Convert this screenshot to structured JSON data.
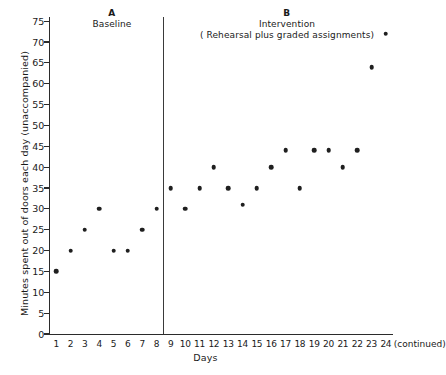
{
  "chart_data": {
    "type": "scatter",
    "title": "",
    "xlabel": "Days",
    "ylabel": "Minutes spent out of doors each day (unaccompanied)",
    "xlim": [
      0.5,
      24.5
    ],
    "ylim": [
      0,
      76
    ],
    "grid": false,
    "legend": "none",
    "x_tick_labels": [
      "1",
      "2",
      "3",
      "4",
      "5",
      "6",
      "7",
      "8",
      "9",
      "10",
      "11",
      "12",
      "13",
      "14",
      "15",
      "16",
      "17",
      "18",
      "19",
      "20",
      "21",
      "22",
      "23",
      "24"
    ],
    "x_extra_label": "(continued)",
    "y_ticks": [
      0,
      5,
      10,
      15,
      20,
      25,
      30,
      35,
      40,
      45,
      50,
      55,
      60,
      65,
      70,
      75
    ],
    "phase_divider_x": 12.5,
    "phases": [
      {
        "letter": "A",
        "name": "Baseline",
        "sub": "",
        "x_start": 1,
        "x_end": 12
      },
      {
        "letter": "B",
        "name": "Intervention",
        "sub": "( Rehearsal plus graded assignments)",
        "x_start": 13,
        "x_end": 24
      }
    ],
    "series": [
      {
        "name": "Minutes out of doors",
        "marker": "filled-circle",
        "color": "#1f1f1f",
        "x": [
          1,
          2,
          3,
          4,
          5,
          6,
          7,
          8,
          9,
          10,
          11,
          12,
          13,
          14,
          15,
          16,
          17,
          18,
          19,
          20,
          21,
          22,
          23,
          24
        ],
        "values": [
          15,
          20,
          25,
          30,
          20,
          20,
          25,
          30,
          35,
          30,
          35,
          40,
          35,
          31,
          35,
          40,
          44,
          35,
          44,
          44,
          40,
          44,
          64,
          72
        ]
      }
    ]
  },
  "figure": {
    "caption_fragment": ""
  }
}
